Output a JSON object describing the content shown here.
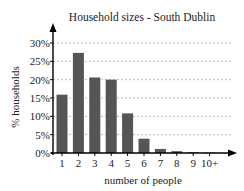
{
  "chart_data": {
    "type": "bar",
    "title": "Household sizes - South Dublin",
    "xlabel": "number of people",
    "ylabel": "% households",
    "categories": [
      "1",
      "2",
      "3",
      "4",
      "5",
      "6",
      "7",
      "8",
      "9",
      "10+"
    ],
    "values": [
      15.9,
      27.3,
      20.6,
      20.0,
      10.8,
      3.9,
      1.1,
      0.5,
      0.2,
      0.1
    ],
    "unit": "%",
    "ylim": [
      0,
      30
    ],
    "yticks": [
      "0%",
      "5%",
      "10%",
      "15%",
      "20%",
      "25%",
      "30%"
    ],
    "grid": true,
    "grid_style": "dashed horizontal",
    "bar_color": "#555555",
    "legend": null
  }
}
